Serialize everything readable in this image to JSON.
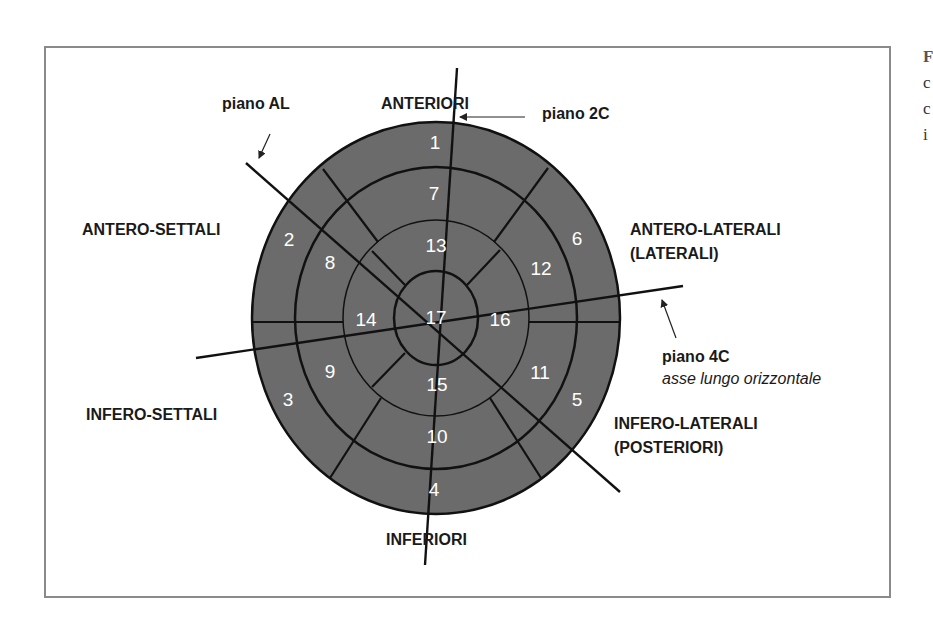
{
  "figure": {
    "colors": {
      "segment_fill": "#6b6b6b",
      "line": "#111111",
      "frame": "#8a8a8a",
      "segment_text": "#ffffff"
    }
  },
  "regions": {
    "anteriori": "ANTERIORI",
    "antero_settali": "ANTERO-SETTALI",
    "antero_laterali": "ANTERO-LATERALI",
    "antero_laterali_sub": "(LATERALI)",
    "infero_settali": "INFERO-SETTALI",
    "infero_laterali": "INFERO-LATERALI",
    "infero_laterali_sub": "(POSTERIORI)",
    "inferiori": "INFERIORI"
  },
  "planes": {
    "al": "piano AL",
    "two_c": "piano 2C",
    "four_c": "piano 4C",
    "four_c_sub": "asse lungo orizzontale"
  },
  "segments": {
    "s1": "1",
    "s2": "2",
    "s3": "3",
    "s4": "4",
    "s5": "5",
    "s6": "6",
    "s7": "7",
    "s8": "8",
    "s9": "9",
    "s10": "10",
    "s11": "11",
    "s12": "12",
    "s13": "13",
    "s14": "14",
    "s15": "15",
    "s16": "16",
    "s17": "17"
  },
  "side_text": {
    "line1": "F",
    "line2": "c",
    "line3": "c",
    "line4": "i"
  }
}
